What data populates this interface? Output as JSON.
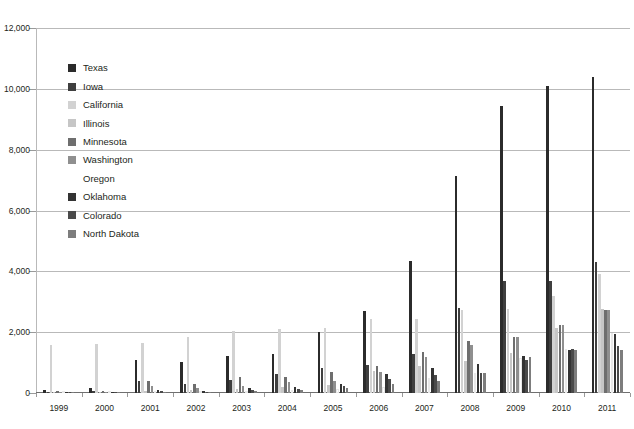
{
  "chart_data": {
    "type": "bar",
    "title": "",
    "subtitle": "",
    "xlabel": "",
    "ylabel": "",
    "grid": true,
    "legend_position": "inside-top-left",
    "ylim": [
      0,
      12000
    ],
    "ytick_values": [
      0,
      2000,
      4000,
      6000,
      8000,
      10000,
      12000
    ],
    "ytick_labels": [
      "0",
      "2,000",
      "4,000",
      "6,000",
      "8,000",
      "10,000",
      "12,000"
    ],
    "categories": [
      "1999",
      "2000",
      "2001",
      "2002",
      "2003",
      "2004",
      "2005",
      "2006",
      "2007",
      "2008",
      "2009",
      "2010",
      "2011"
    ],
    "series": [
      {
        "name": "Texas",
        "color": "#2b2b2b",
        "values": [
          90,
          180,
          1100,
          1010,
          1230,
          1280,
          2000,
          2710,
          4350,
          7120,
          9420,
          10090,
          10380
        ]
      },
      {
        "name": "Iowa",
        "color": "#3f3f3f",
        "values": [
          30,
          60,
          400,
          310,
          420,
          630,
          830,
          930,
          1290,
          2790,
          3670,
          3680,
          4320
        ]
      },
      {
        "name": "California",
        "color": "#d2d2d2",
        "values": [
          1590,
          1600,
          1630,
          1840,
          2040,
          2100,
          2150,
          2440,
          2440,
          2720,
          2770,
          3180,
          3920
        ]
      },
      {
        "name": "Illinois",
        "color": "#c6c6c6",
        "values": [
          40,
          35,
          80,
          90,
          140,
          200,
          270,
          730,
          900,
          1060,
          1320,
          2150,
          2750
        ]
      },
      {
        "name": "Minnesota",
        "color": "#6e6e6e",
        "values": [
          70,
          50,
          410,
          280,
          520,
          520,
          690,
          900,
          1340,
          1700,
          1840,
          2230,
          2730
        ]
      },
      {
        "name": "Washington",
        "color": "#8f8f8f",
        "values": [
          40,
          30,
          220,
          180,
          220,
          350,
          410,
          680,
          1200,
          1570,
          1830,
          2230,
          2720
        ]
      },
      {
        "name": "Oregon",
        "color": "#ffffff",
        "values": [
          10,
          10,
          40,
          40,
          60,
          90,
          130,
          200,
          480,
          650,
          1140,
          1450,
          1980
        ]
      },
      {
        "name": "Oklahoma",
        "color": "#333333",
        "values": [
          20,
          15,
          100,
          80,
          160,
          200,
          290,
          620,
          820,
          950,
          1210,
          1400,
          1950
        ]
      },
      {
        "name": "Colorado",
        "color": "#4a4a4a",
        "values": [
          10,
          10,
          60,
          40,
          90,
          130,
          230,
          450,
          580,
          660,
          1070,
          1460,
          1540
        ]
      },
      {
        "name": "North Dakota",
        "color": "#7d7d7d",
        "values": [
          5,
          5,
          30,
          20,
          70,
          110,
          150,
          300,
          380,
          660,
          1180,
          1420,
          1430
        ]
      }
    ]
  },
  "legend": {
    "items": [
      {
        "label": "Texas"
      },
      {
        "label": "Iowa"
      },
      {
        "label": "California"
      },
      {
        "label": "Illinois"
      },
      {
        "label": "Minnesota"
      },
      {
        "label": "Washington"
      },
      {
        "label": "Oregon"
      },
      {
        "label": "Oklahoma"
      },
      {
        "label": "Colorado"
      },
      {
        "label": "North Dakota"
      }
    ]
  }
}
